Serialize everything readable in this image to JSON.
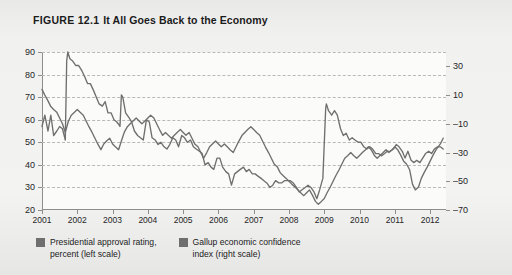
{
  "figure": {
    "number": "FIGURE 12.1",
    "caption": "It All Goes Back to the Economy"
  },
  "legend": {
    "items": [
      {
        "label": "Presidential approval rating,\npercent (left scale)",
        "swatch_color": "#6f6f6f"
      },
      {
        "label": "Gallup economic confidence\nindex (right scale)",
        "swatch_color": "#6f6f6f"
      }
    ]
  },
  "colors": {
    "page_background": "#ededec",
    "plot_background": "#fbfbfa",
    "series_line": "#6f6f6f",
    "gridline": "#b9b9b9",
    "axis": "#8e8e8e",
    "text": "#1b1b1b"
  },
  "chart_data": {
    "type": "line",
    "title": "It All Goes Back to the Economy",
    "xlabel": "",
    "grid": true,
    "legend_position": "bottom-left",
    "x_tick_labels": [
      "2001",
      "2002",
      "2003",
      "2004",
      "2005",
      "2006",
      "2007",
      "2008",
      "2009",
      "2010",
      "2011",
      "2012"
    ],
    "x_tick_values": [
      2001,
      2002,
      2003,
      2004,
      2005,
      2006,
      2007,
      2008,
      2009,
      2010,
      2011,
      2012
    ],
    "xlim": [
      2001.0,
      2012.45
    ],
    "axes": [
      {
        "id": "left",
        "ylabel": "Presidential approval rating, percent",
        "ticks": [
          20,
          30,
          40,
          50,
          60,
          70,
          80,
          90
        ],
        "ylim": [
          20,
          90
        ]
      },
      {
        "id": "right",
        "ylabel": "Gallup economic confidence index",
        "ticks": [
          -70,
          -50,
          -30,
          -10,
          10,
          30
        ],
        "ylim": [
          -70,
          40
        ]
      }
    ],
    "series": [
      {
        "name": "Presidential approval rating, percent (left scale)",
        "axis": "left",
        "color": "#6f6f6f",
        "x": [
          2001.0,
          2001.08,
          2001.17,
          2001.25,
          2001.33,
          2001.42,
          2001.5,
          2001.58,
          2001.66,
          2001.7,
          2001.73,
          2001.79,
          2001.87,
          2001.96,
          2002.04,
          2002.12,
          2002.21,
          2002.29,
          2002.37,
          2002.46,
          2002.54,
          2002.62,
          2002.71,
          2002.79,
          2002.87,
          2002.96,
          2003.04,
          2003.12,
          2003.17,
          2003.21,
          2003.25,
          2003.29,
          2003.37,
          2003.46,
          2003.54,
          2003.62,
          2003.71,
          2003.79,
          2003.87,
          2003.96,
          2004.04,
          2004.12,
          2004.21,
          2004.29,
          2004.37,
          2004.46,
          2004.54,
          2004.62,
          2004.71,
          2004.79,
          2004.87,
          2004.96,
          2005.04,
          2005.12,
          2005.21,
          2005.29,
          2005.37,
          2005.46,
          2005.54,
          2005.62,
          2005.71,
          2005.79,
          2005.87,
          2005.96,
          2006.04,
          2006.12,
          2006.21,
          2006.29,
          2006.37,
          2006.46,
          2006.54,
          2006.62,
          2006.71,
          2006.79,
          2006.87,
          2006.96,
          2007.04,
          2007.12,
          2007.21,
          2007.29,
          2007.37,
          2007.46,
          2007.54,
          2007.62,
          2007.71,
          2007.79,
          2007.87,
          2007.96,
          2008.04,
          2008.12,
          2008.21,
          2008.29,
          2008.37,
          2008.46,
          2008.54,
          2008.62,
          2008.71,
          2008.79,
          2008.87,
          2008.96,
          2009.04,
          2009.06,
          2009.12,
          2009.21,
          2009.29,
          2009.37,
          2009.46,
          2009.54,
          2009.62,
          2009.71,
          2009.79,
          2009.87,
          2009.96,
          2010.04,
          2010.12,
          2010.21,
          2010.29,
          2010.37,
          2010.46,
          2010.54,
          2010.62,
          2010.71,
          2010.79,
          2010.87,
          2010.96,
          2011.04,
          2011.12,
          2011.21,
          2011.29,
          2011.37,
          2011.46,
          2011.54,
          2011.62,
          2011.71,
          2011.79,
          2011.87,
          2011.96,
          2012.04,
          2012.12,
          2012.21,
          2012.29,
          2012.37
        ],
        "y": [
          57,
          62,
          55,
          62,
          53,
          55,
          57,
          56,
          51,
          86,
          90,
          87,
          86,
          84,
          84,
          82,
          79,
          76,
          76,
          73,
          70,
          67,
          66,
          68,
          63,
          63,
          60,
          59,
          58,
          57,
          71,
          70,
          63,
          61,
          59,
          55,
          53,
          52,
          51,
          60,
          59,
          52,
          51,
          49,
          50,
          48,
          47,
          49,
          52,
          51,
          48,
          53,
          52,
          50,
          51,
          48,
          47,
          46,
          45,
          40,
          41,
          39,
          38,
          43,
          43,
          39,
          37,
          36,
          31,
          36,
          37,
          38,
          39,
          37,
          38,
          36,
          36,
          35,
          34,
          33,
          32,
          30,
          31,
          33,
          32,
          32,
          33,
          33,
          33,
          32,
          30,
          28,
          29,
          30,
          31,
          30,
          28,
          25,
          29,
          34,
          65,
          67,
          64,
          62,
          64,
          62,
          56,
          53,
          54,
          51,
          52,
          51,
          50,
          50,
          48,
          47,
          48,
          47,
          45,
          45,
          44,
          45,
          46,
          46,
          47,
          49,
          48,
          46,
          43,
          46,
          42,
          41,
          42,
          41,
          43,
          45,
          46,
          45,
          47,
          48,
          48,
          47
        ]
      },
      {
        "name": "Gallup economic confidence index (right scale)",
        "axis": "right",
        "color": "#6f6f6f",
        "x": [
          2001.0,
          2001.08,
          2001.17,
          2001.25,
          2001.33,
          2001.42,
          2001.5,
          2001.58,
          2001.66,
          2001.75,
          2001.83,
          2001.92,
          2002.0,
          2002.08,
          2002.17,
          2002.25,
          2002.33,
          2002.42,
          2002.5,
          2002.58,
          2002.67,
          2002.75,
          2002.83,
          2002.92,
          2003.0,
          2003.08,
          2003.17,
          2003.25,
          2003.33,
          2003.42,
          2003.5,
          2003.58,
          2003.67,
          2003.75,
          2003.83,
          2003.92,
          2004.0,
          2004.08,
          2004.17,
          2004.25,
          2004.33,
          2004.42,
          2004.5,
          2004.58,
          2004.67,
          2004.75,
          2004.83,
          2004.92,
          2005.0,
          2005.08,
          2005.17,
          2005.25,
          2005.33,
          2005.42,
          2005.5,
          2005.58,
          2005.67,
          2005.75,
          2005.83,
          2005.92,
          2006.0,
          2006.08,
          2006.17,
          2006.25,
          2006.33,
          2006.42,
          2006.5,
          2006.58,
          2006.67,
          2006.75,
          2006.83,
          2006.92,
          2007.0,
          2007.08,
          2007.17,
          2007.25,
          2007.33,
          2007.42,
          2007.5,
          2007.58,
          2007.67,
          2007.75,
          2007.83,
          2007.92,
          2008.0,
          2008.08,
          2008.17,
          2008.25,
          2008.33,
          2008.42,
          2008.5,
          2008.58,
          2008.67,
          2008.75,
          2008.83,
          2008.92,
          2009.0,
          2009.08,
          2009.17,
          2009.25,
          2009.33,
          2009.42,
          2009.5,
          2009.58,
          2009.67,
          2009.75,
          2009.83,
          2009.92,
          2010.0,
          2010.08,
          2010.17,
          2010.25,
          2010.33,
          2010.42,
          2010.5,
          2010.58,
          2010.67,
          2010.75,
          2010.83,
          2010.92,
          2011.0,
          2011.08,
          2011.17,
          2011.25,
          2011.33,
          2011.42,
          2011.5,
          2011.58,
          2011.67,
          2011.75,
          2011.83,
          2011.92,
          2012.0,
          2012.08,
          2012.17,
          2012.29,
          2012.37
        ],
        "y": [
          14,
          10,
          6,
          2,
          0,
          -2,
          -6,
          -10,
          -16,
          -8,
          -4,
          -2,
          0,
          -2,
          -4,
          -8,
          -12,
          -16,
          -20,
          -24,
          -28,
          -24,
          -22,
          -20,
          -24,
          -26,
          -28,
          -22,
          -16,
          -12,
          -10,
          -8,
          -6,
          -8,
          -10,
          -8,
          -6,
          -4,
          -6,
          -10,
          -14,
          -18,
          -16,
          -18,
          -20,
          -18,
          -16,
          -14,
          -16,
          -18,
          -16,
          -20,
          -24,
          -26,
          -30,
          -34,
          -30,
          -26,
          -24,
          -22,
          -24,
          -26,
          -24,
          -26,
          -28,
          -30,
          -26,
          -22,
          -18,
          -16,
          -14,
          -12,
          -14,
          -16,
          -18,
          -22,
          -26,
          -30,
          -34,
          -38,
          -40,
          -44,
          -46,
          -48,
          -50,
          -52,
          -54,
          -56,
          -58,
          -60,
          -58,
          -56,
          -60,
          -64,
          -66,
          -64,
          -62,
          -58,
          -54,
          -50,
          -46,
          -42,
          -38,
          -34,
          -32,
          -30,
          -32,
          -34,
          -32,
          -30,
          -28,
          -26,
          -28,
          -32,
          -34,
          -32,
          -30,
          -28,
          -30,
          -28,
          -26,
          -28,
          -32,
          -36,
          -38,
          -42,
          -52,
          -56,
          -54,
          -48,
          -44,
          -40,
          -36,
          -32,
          -28,
          -24,
          -20
        ]
      }
    ]
  }
}
